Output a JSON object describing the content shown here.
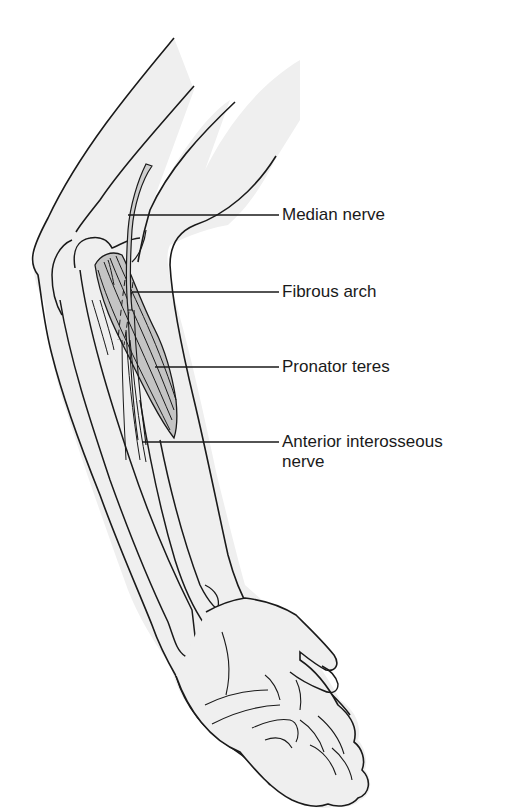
{
  "figure": {
    "colors": {
      "background": "#ffffff",
      "skin_fill": "#efefef",
      "muscle_fill": "#c4c4c4",
      "nerve_fill": "#cfcfcf",
      "outline": "#1a1a1a"
    },
    "labels": [
      {
        "id": "median-nerve",
        "text": "Median nerve",
        "line_y": 215,
        "line_x1": 128,
        "line_x2": 279,
        "text_x": 282,
        "text_y": 205
      },
      {
        "id": "fibrous-arch",
        "text": "Fibrous arch",
        "line_y": 292,
        "line_x1": 132,
        "line_x2": 279,
        "text_x": 282,
        "text_y": 282
      },
      {
        "id": "pronator-teres",
        "text": "Pronator teres",
        "line_y": 367,
        "line_x1": 155,
        "line_x2": 279,
        "text_x": 282,
        "text_y": 357
      },
      {
        "id": "anterior-interosseous-nerve",
        "text": "Anterior interosseous",
        "text_line2": "nerve",
        "line_y": 442,
        "line_x1": 142,
        "line_x2": 279,
        "text_x": 282,
        "text_y": 432
      }
    ]
  }
}
